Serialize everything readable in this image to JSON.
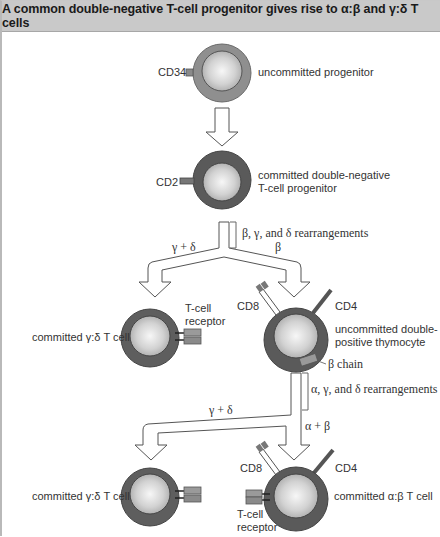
{
  "header": {
    "title": "A common double-negative T-cell progenitor gives rise to α:β and γ:δ T cells"
  },
  "diagram": {
    "colors": {
      "outer_light": "#8f8f8f",
      "outer_dark": "#5a5a5a",
      "nucleus_center": "#f4f4f4",
      "nucleus_edge": "#b0b0b0",
      "arrow_fill": "#ffffff",
      "arrow_stroke": "#555555",
      "receptor_fill": "#9a9a9a",
      "header_bg": "#c9c9c9"
    },
    "cells": [
      {
        "id": "uncommitted-progenitor",
        "label_lines": [
          "uncommitted progenitor"
        ],
        "marker": "CD34"
      },
      {
        "id": "committed-dn-progenitor",
        "label_lines": [
          "committed double-negative",
          "T-cell progenitor"
        ],
        "marker": "CD2"
      },
      {
        "id": "committed-gd-1",
        "label_lines": [
          "committed γ:δ T cell"
        ],
        "receptor_label": [
          "T-cell",
          "receptor"
        ]
      },
      {
        "id": "uncommitted-dp-thymocyte",
        "label_lines": [
          "uncommitted double-",
          "positive thymocyte"
        ],
        "markers": [
          "CD8",
          "CD4"
        ],
        "chain_label": "β chain"
      },
      {
        "id": "committed-gd-2",
        "label_lines": [
          "committed γ:δ T cell"
        ]
      },
      {
        "id": "committed-ab",
        "label_lines": [
          "committed α:β T cell"
        ],
        "markers": [
          "CD8",
          "CD4"
        ],
        "receptor_label": [
          "T-cell",
          "receptor"
        ]
      }
    ],
    "arrows": {
      "rearrangements_1": "β, γ, and δ rearrangements",
      "branch1_left": "γ + δ",
      "branch1_right": "β",
      "rearrangements_2": "α, γ, and δ rearrangements",
      "branch2_left": "γ + δ",
      "branch2_right": "α + β"
    }
  }
}
